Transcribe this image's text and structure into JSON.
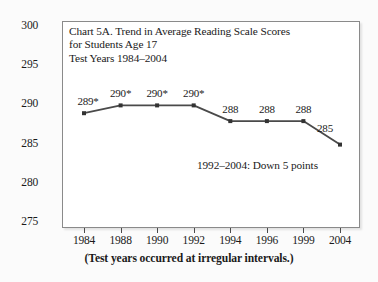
{
  "chart_data": {
    "type": "line",
    "title": "Chart 5A. Trend in Average Reading Scale Scores for Students Age 17 Test Years 1984–2004",
    "title_lines": [
      "Chart 5A. Trend in Average Reading Scale Scores",
      "for Students Age 17",
      "Test Years 1984–2004"
    ],
    "categories": [
      "1984",
      "1988",
      "1990",
      "1992",
      "1994",
      "1996",
      "1999",
      "2004"
    ],
    "values": [
      289,
      290,
      290,
      290,
      288,
      288,
      288,
      285
    ],
    "point_labels": [
      "289*",
      "290*",
      "290*",
      "290*",
      "288",
      "288",
      "288",
      "285"
    ],
    "xlabel": "",
    "ylabel": "",
    "ylim": [
      275,
      300
    ],
    "yticks": [
      "275",
      "280",
      "285",
      "290",
      "295",
      "300"
    ],
    "ytick_values": [
      275,
      280,
      285,
      290,
      295,
      300
    ],
    "grid": false,
    "legend": "none",
    "annotations": [
      "1992–2004: Down 5 points"
    ],
    "caption": "(Test years occurred at irregular intervals.)",
    "series_color": "#4a4a4a",
    "marker_color": "#333333",
    "axis_color": "#8a8a8a",
    "background": "#ffffff",
    "page_background": "#fbfbfb"
  }
}
